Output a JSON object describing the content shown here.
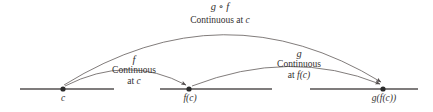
{
  "diagram": {
    "stroke_color": "#555050",
    "text_color": "#33302f",
    "axis": {
      "name": "number-line",
      "y": 89,
      "segments": [
        {
          "x1": 20,
          "x2": 114
        },
        {
          "x1": 160,
          "x2": 272
        },
        {
          "x1": 310,
          "x2": 418
        }
      ]
    },
    "points": [
      {
        "id": "c",
        "label": "c",
        "x": 63,
        "y": 89
      },
      {
        "id": "fc",
        "label": "f(c)",
        "x": 189,
        "y": 89
      },
      {
        "id": "gfc",
        "label": "g(f(c))",
        "x": 383,
        "y": 89
      }
    ],
    "arcs": [
      {
        "id": "arc-f",
        "function_label": "f",
        "caption_line1": "Continuous",
        "caption_line2_prefix": "at ",
        "caption_line2_italic": "c",
        "from": "c",
        "to": "fc",
        "peak_y": 62
      },
      {
        "id": "arc-g",
        "function_label": "g",
        "caption_line1": "Continuous",
        "caption_line2_prefix": "at ",
        "caption_line2_italic": "f(c)",
        "from": "fc",
        "to": "gfc",
        "peak_y": 58
      },
      {
        "id": "arc-gof",
        "function_label": "g ∘ f",
        "caption_line1": "Continuous at ",
        "caption_line1_italic": "c",
        "from": "c",
        "to": "gfc",
        "peak_y": 17
      }
    ]
  }
}
